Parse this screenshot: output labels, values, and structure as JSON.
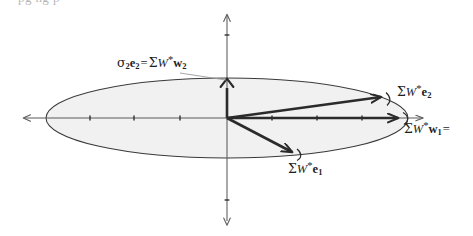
{
  "figure": {
    "type": "vector-diagram",
    "caption_clipped_top": "pg ng p",
    "background_color": "#ffffff",
    "ellipse": {
      "name": "unit-ball-image-ellipse",
      "center_x": 227,
      "center_y": 118,
      "radius_x": 181,
      "radius_y": 40,
      "fill_color": "#f1f1f1",
      "stroke_color": "#3a3a3a"
    },
    "axes": {
      "stroke_color": "#5a5a5a",
      "horizontal": {
        "y": 118,
        "x_start": 23,
        "x_end": 427,
        "ticks_x": [
          90,
          134,
          180,
          272,
          317,
          362
        ]
      },
      "vertical": {
        "x": 227,
        "y_start": 13,
        "y_end": 225,
        "ticks_y": [
          35,
          200
        ]
      }
    },
    "vectors": [
      {
        "name": "sigma-w1-vector",
        "x1": 227,
        "y1": 118,
        "x2": 405,
        "y2": 118,
        "color": "#2b2b2b"
      },
      {
        "name": "sigma-w2-vector",
        "x1": 227,
        "y1": 118,
        "x2": 227,
        "y2": 80,
        "color": "#2b2b2b"
      },
      {
        "name": "sigma-e2-vector",
        "x1": 227,
        "y1": 118,
        "x2": 388,
        "y2": 96,
        "color": "#2b2b2b"
      },
      {
        "name": "sigma-e1-vector",
        "x1": 227,
        "y1": 118,
        "x2": 299,
        "y2": 156,
        "color": "#2b2b2b"
      }
    ],
    "labels": {
      "sigma2_e2_eq_sw_w2": {
        "sigma": "σ",
        "sigma_sub": "2",
        "e": "e",
        "e_sub": "2",
        "equals": "=",
        "Sigma": "Σ",
        "W": "W",
        "star": "*",
        "w": "w",
        "w_sub": "2"
      },
      "sw_e2": {
        "Sigma": "Σ",
        "W": "W",
        "star": "*",
        "e": "e",
        "e_sub": "2"
      },
      "sw_w1": {
        "Sigma": "Σ",
        "W": "W",
        "star": "*",
        "w": "w",
        "w_sub": "1",
        "trailing": "="
      },
      "sw_e1": {
        "Sigma": "Σ",
        "W": "W",
        "star": "*",
        "e": "e",
        "e_sub": "1"
      }
    }
  }
}
